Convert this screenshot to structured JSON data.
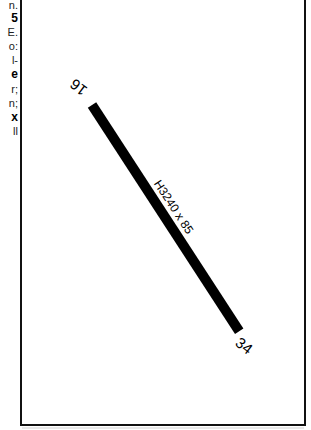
{
  "left_text_fragments": [
    {
      "text": "n.",
      "bold": false,
      "top": -1
    },
    {
      "text": "5",
      "bold": true,
      "top": 12
    },
    {
      "text": "E.",
      "bold": false,
      "top": 26
    },
    {
      "text": "o:",
      "bold": false,
      "top": 40
    },
    {
      "text": "l-",
      "bold": false,
      "top": 54
    },
    {
      "text": "e",
      "bold": true,
      "top": 68
    },
    {
      "text": "r;",
      "bold": false,
      "top": 83
    },
    {
      "text": "n;",
      "bold": false,
      "top": 97
    },
    {
      "text": "x",
      "bold": true,
      "top": 111
    },
    {
      "text": "ll",
      "bold": false,
      "top": 125
    }
  ],
  "diagram": {
    "runway": {
      "designation_north": "16",
      "designation_south": "34",
      "dimensions": "H3240 x 85",
      "start": {
        "x": 92,
        "y": 105
      },
      "end": {
        "x": 239,
        "y": 331
      },
      "color": "#000000"
    },
    "frame_color": "#111111"
  }
}
